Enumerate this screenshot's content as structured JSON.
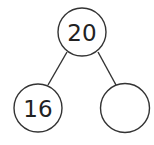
{
  "diagram": {
    "type": "number-bond",
    "nodes": [
      {
        "id": "whole",
        "label": "20",
        "cx": 82,
        "cy": 32,
        "r": 24
      },
      {
        "id": "part-left",
        "label": "16",
        "cx": 38,
        "cy": 108,
        "r": 24
      },
      {
        "id": "part-right",
        "label": "",
        "cx": 125,
        "cy": 108,
        "r": 24.5
      }
    ],
    "edges": [
      {
        "from": "whole",
        "to": "part-left"
      },
      {
        "from": "whole",
        "to": "part-right"
      }
    ],
    "colors": {
      "stroke": "#333333",
      "text": "#222222",
      "background": "#ffffff"
    }
  }
}
